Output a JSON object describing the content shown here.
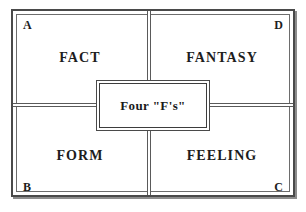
{
  "figure": {
    "center_box": {
      "label": "Four \"F's\""
    },
    "corners": {
      "top_left": "A",
      "top_right": "D",
      "bottom_left": "B",
      "bottom_right": "C"
    },
    "quadrants": [
      {
        "position": "top-left",
        "corner": "A",
        "label": "FACT"
      },
      {
        "position": "top-right",
        "corner": "D",
        "label": "FANTASY"
      },
      {
        "position": "bottom-left",
        "corner": "B",
        "label": "FORM"
      },
      {
        "position": "bottom-right",
        "corner": "C",
        "label": "FEELING"
      }
    ],
    "colors": {
      "background": "#ffffff",
      "rule": "#4a4a4a",
      "text": "#1d1d1d"
    }
  }
}
